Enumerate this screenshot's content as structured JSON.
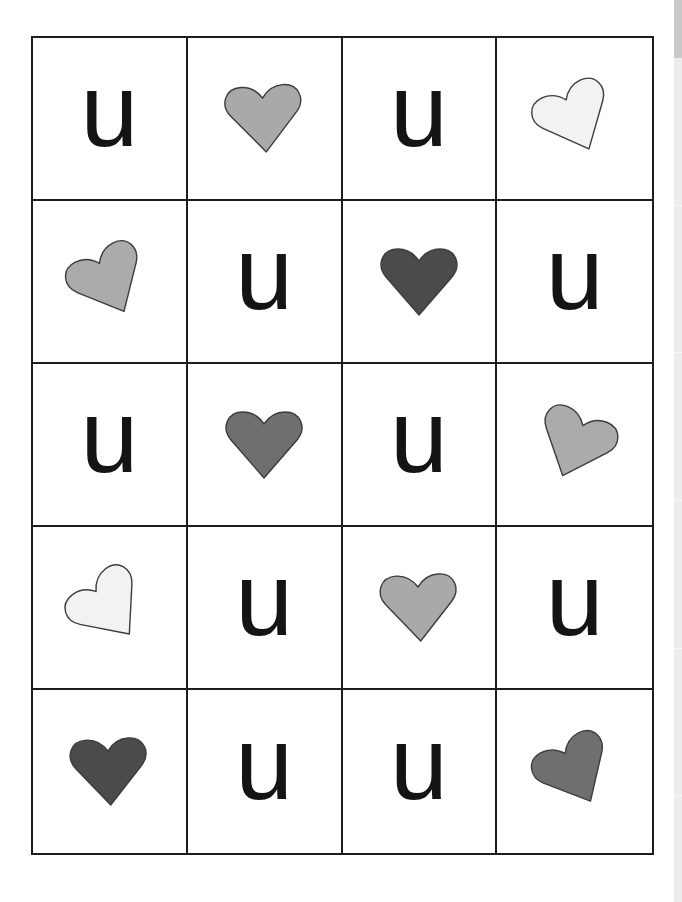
{
  "worksheet": {
    "rows": 5,
    "columns": 4,
    "letter": "u",
    "colors": {
      "grid_line": "#1e1e1e",
      "letter": "#141414",
      "heart_outline": "#3c3c3c"
    },
    "cells": [
      [
        {
          "type": "letter",
          "text": "u"
        },
        {
          "type": "heart",
          "fill": "#a9a9a9",
          "rotate": -4
        },
        {
          "type": "letter",
          "text": "u"
        },
        {
          "type": "heart",
          "fill": "#f2f2f2",
          "rotate": -25
        }
      ],
      [
        {
          "type": "heart",
          "fill": "#ababab",
          "rotate": -27
        },
        {
          "type": "letter",
          "text": "u"
        },
        {
          "type": "heart",
          "fill": "#4b4b4b",
          "rotate": 0
        },
        {
          "type": "letter",
          "text": "u"
        }
      ],
      [
        {
          "type": "letter",
          "text": "u"
        },
        {
          "type": "heart",
          "fill": "#6f6f6f",
          "rotate": 0
        },
        {
          "type": "letter",
          "text": "u"
        },
        {
          "type": "heart",
          "fill": "#ababab",
          "rotate": 22
        }
      ],
      [
        {
          "type": "heart",
          "fill": "#f2f2f2",
          "rotate": -38
        },
        {
          "type": "letter",
          "text": "u"
        },
        {
          "type": "heart",
          "fill": "#a9a9a9",
          "rotate": -3
        },
        {
          "type": "letter",
          "text": "u"
        }
      ],
      [
        {
          "type": "heart",
          "fill": "#4b4b4b",
          "rotate": -3
        },
        {
          "type": "letter",
          "text": "u"
        },
        {
          "type": "letter",
          "text": "u"
        },
        {
          "type": "heart",
          "fill": "#6f6f6f",
          "rotate": -28
        }
      ]
    ]
  },
  "scrollbar": {
    "track_color": "#ececec",
    "thumb_color": "#c9c9c9"
  }
}
